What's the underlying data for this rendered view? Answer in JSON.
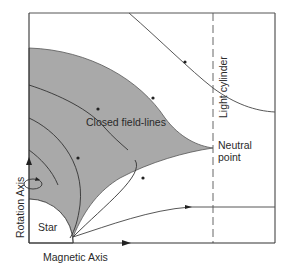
{
  "diagram": {
    "type": "pulsar-magnetosphere",
    "colors": {
      "background": "#ffffff",
      "shaded_region": "#a9a9a9",
      "line": "#3a3a3a",
      "frame": "#555555"
    },
    "labels": {
      "closed_field_lines": "Closed field-lines",
      "light_cylinder": "Light  cylinder",
      "neutral_point_line1": "Neutral",
      "neutral_point_line2": "point",
      "star": "Star",
      "rotation_axis": "Rotation   Axis",
      "magnetic_axis": "Magnetic Axis"
    },
    "elements": [
      {
        "name": "star",
        "shape": "quarter-circle"
      },
      {
        "name": "closed-field-region",
        "shape": "shaded-area"
      },
      {
        "name": "light-cylinder",
        "shape": "dashed-vertical-line"
      },
      {
        "name": "neutral-point",
        "shape": "cusp"
      },
      {
        "name": "open-field-line-upper",
        "shape": "curve"
      },
      {
        "name": "open-field-line-lower",
        "shape": "curve"
      },
      {
        "name": "rotation-arrow",
        "shape": "loop-arrow"
      }
    ]
  }
}
